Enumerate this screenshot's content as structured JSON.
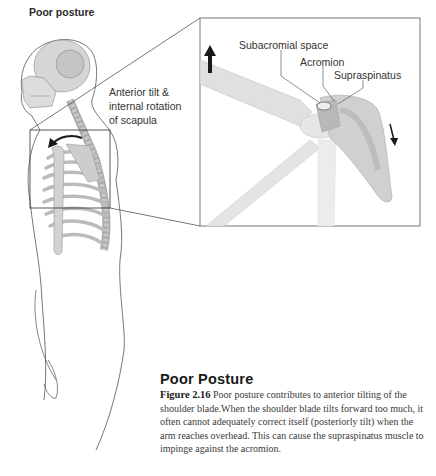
{
  "figure": {
    "heading": "Poor posture",
    "labels": {
      "tilt_line1": "Anterior tilt &",
      "tilt_line2": "internal rotation",
      "tilt_line3": "of scapula",
      "subacromial": "Subacromial space",
      "acromion": "Acromion",
      "supraspinatus": "Supraspinatus"
    },
    "icons": {
      "up_arrow": "arrow-up-icon",
      "down_arrow": "arrow-down-icon",
      "rotation_arrow": "curved-arrow-icon"
    }
  },
  "caption": {
    "title": "Poor Posture",
    "figure_number": "Figure 2.16",
    "text": " Poor posture contributes to anterior tilting of the shoulder blade.When the shoulder blade tilts forward too much, it often cannot adequately correct itself (posteriorly tilt) when the arm reaches overhead. This can cause the supraspinatus muscle to impinge against the acromion."
  }
}
